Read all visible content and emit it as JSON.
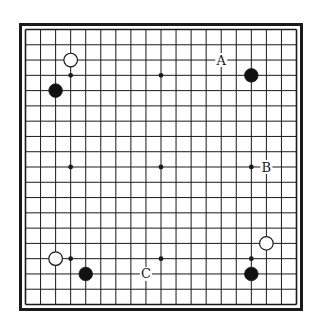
{
  "diagram": {
    "board_size": 19,
    "star_points": [
      [
        3,
        3
      ],
      [
        9,
        3
      ],
      [
        15,
        3
      ],
      [
        3,
        9
      ],
      [
        9,
        9
      ],
      [
        15,
        9
      ],
      [
        3,
        15
      ],
      [
        9,
        15
      ],
      [
        15,
        15
      ]
    ],
    "stones": [
      {
        "color": "white",
        "col": 3,
        "row": 2
      },
      {
        "color": "black",
        "col": 2,
        "row": 4
      },
      {
        "color": "black",
        "col": 15,
        "row": 3
      },
      {
        "color": "white",
        "col": 2,
        "row": 15
      },
      {
        "color": "black",
        "col": 4,
        "row": 16
      },
      {
        "color": "white",
        "col": 16,
        "row": 14
      },
      {
        "color": "black",
        "col": 15,
        "row": 16
      }
    ],
    "labels": [
      {
        "text": "A",
        "col": 13,
        "row": 2
      },
      {
        "text": "B",
        "col": 16,
        "row": 9
      },
      {
        "text": "C",
        "col": 8,
        "row": 16
      }
    ],
    "colors": {
      "line": "#1a1a1a",
      "black_stone": "#111111",
      "white_stone": "#ffffff",
      "background": "#ffffff"
    }
  }
}
